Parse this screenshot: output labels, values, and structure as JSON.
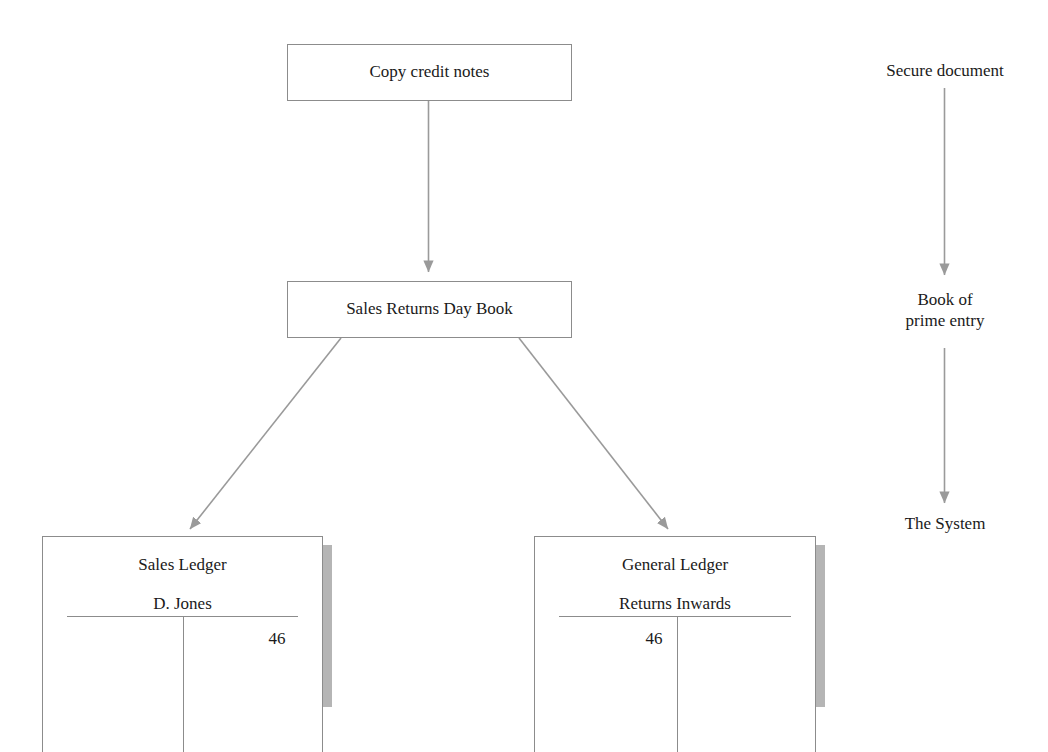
{
  "diagram": {
    "line_color": "#8c8c8c",
    "text_color": "#1a1a1a",
    "shadow_color": "#b5b5b5",
    "background": "#ffffff"
  },
  "boxes": [
    {
      "id": "copy-credit-notes",
      "label": "Copy credit notes"
    },
    {
      "id": "sales-returns-day-book",
      "label": "Sales Returns Day Book"
    }
  ],
  "ledgers": [
    {
      "id": "sales-ledger",
      "title": "Sales Ledger",
      "account": "D. Jones",
      "debit_amount": "",
      "credit_amount": "46"
    },
    {
      "id": "general-ledger",
      "title": "General Ledger",
      "account": "Returns Inwards",
      "debit_amount": "46",
      "credit_amount": ""
    }
  ],
  "annotations": [
    {
      "id": "secure-document",
      "label": "Secure document"
    },
    {
      "id": "book-of-prime-entry",
      "label": "Book of\nprime entry"
    },
    {
      "id": "the-system",
      "label": "The System"
    }
  ],
  "connectors": [
    {
      "id": "notes-to-daybook",
      "from": "copy-credit-notes",
      "to": "sales-returns-day-book"
    },
    {
      "id": "daybook-to-sales-ledger",
      "from": "sales-returns-day-book",
      "to": "sales-ledger"
    },
    {
      "id": "daybook-to-general-ledger",
      "from": "sales-returns-day-book",
      "to": "general-ledger"
    },
    {
      "id": "secure-document-to-prime-entry",
      "from": "secure-document",
      "to": "book-of-prime-entry"
    },
    {
      "id": "prime-entry-to-system",
      "from": "book-of-prime-entry",
      "to": "the-system"
    }
  ]
}
